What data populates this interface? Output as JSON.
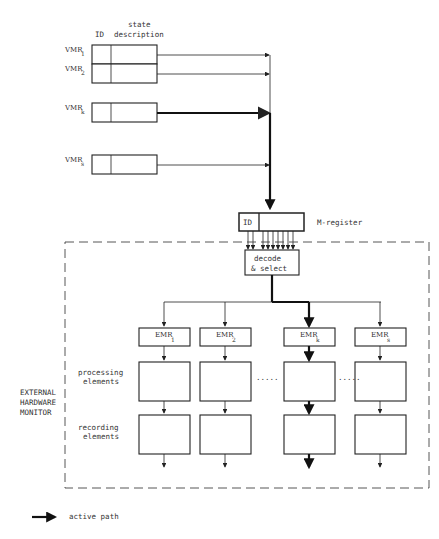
{
  "header": {
    "id_label": "ID",
    "state_label_line1": "state",
    "state_label_line2": "description"
  },
  "vmrs": [
    {
      "prefix": "VMR",
      "sub": "1",
      "active": false
    },
    {
      "prefix": "VMR",
      "sub": "2",
      "active": false
    },
    {
      "prefix": "VMR",
      "sub": "k",
      "active": true
    },
    {
      "prefix": "VMR",
      "sub": "s",
      "active": false
    }
  ],
  "m_register": {
    "id_label": "ID",
    "label": "M-register"
  },
  "decode": {
    "line1": "decode",
    "line2": "& select"
  },
  "monitor": {
    "line1": "EXTERNAL",
    "line2": "HARDWARE",
    "line3": "MONITOR"
  },
  "rows": {
    "processing_line1": "processing",
    "processing_line2": "elements",
    "recording_line1": "recording",
    "recording_line2": "elements"
  },
  "emrs": [
    {
      "prefix": "EMR",
      "sub": "1",
      "active": false
    },
    {
      "prefix": "EMR",
      "sub": "2",
      "active": false
    },
    {
      "prefix": "EMR",
      "sub": "k",
      "active": true
    },
    {
      "prefix": "EMR",
      "sub": "s",
      "active": false
    }
  ],
  "ellipsis": ".....",
  "legend": {
    "label": "active path"
  }
}
